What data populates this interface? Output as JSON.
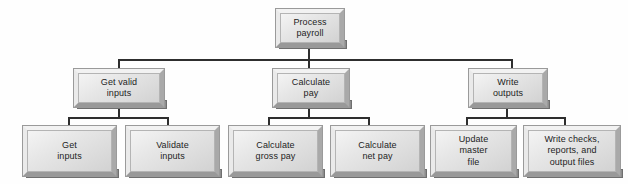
{
  "diagram": {
    "type": "structure-chart",
    "colors": {
      "background": "#fefefe",
      "box_face": "#dcdcdc",
      "box_highlight": "#f2f2f2",
      "box_shadow": "#8d8d8d",
      "connector": "#2e2e2e",
      "text": "#1d1d1d"
    },
    "levels": [
      {
        "level": 1,
        "nodes": [
          {
            "id": "process-payroll",
            "label": "Process\npayroll",
            "x": 275,
            "y": 8,
            "w": 70,
            "h": 40
          }
        ]
      },
      {
        "level": 2,
        "nodes": [
          {
            "id": "get-valid-inputs",
            "label": "Get valid\ninputs",
            "x": 73,
            "y": 68,
            "w": 92,
            "h": 40
          },
          {
            "id": "calculate-pay",
            "label": "Calculate\npay",
            "x": 272,
            "y": 68,
            "w": 78,
            "h": 40
          },
          {
            "id": "write-outputs",
            "label": "Write\noutputs",
            "x": 468,
            "y": 68,
            "w": 80,
            "h": 40
          }
        ]
      },
      {
        "level": 3,
        "nodes": [
          {
            "id": "get-inputs",
            "label": "Get\ninputs",
            "x": 22,
            "y": 125,
            "w": 95,
            "h": 52
          },
          {
            "id": "validate-inputs",
            "label": "Validate\ninputs",
            "x": 125,
            "y": 125,
            "w": 95,
            "h": 52
          },
          {
            "id": "calculate-gross-pay",
            "label": "Calculate\ngross pay",
            "x": 228,
            "y": 125,
            "w": 95,
            "h": 52
          },
          {
            "id": "calculate-net-pay",
            "label": "Calculate\nnet pay",
            "x": 330,
            "y": 125,
            "w": 95,
            "h": 52
          },
          {
            "id": "update-master-file",
            "label": "Update\nmaster\nfile",
            "x": 430,
            "y": 125,
            "w": 87,
            "h": 52
          },
          {
            "id": "write-checks-reports-output-files",
            "label": "Write checks,\nreports, and\noutput files",
            "x": 523,
            "y": 125,
            "w": 98,
            "h": 52
          }
        ]
      }
    ],
    "connectors": {
      "root_drop": {
        "x": 309,
        "y": 48,
        "h": 12
      },
      "main_bus": {
        "x": 118,
        "y": 59,
        "w": 395
      },
      "level2_drops": [
        {
          "x": 118,
          "y": 59,
          "h": 11
        },
        {
          "x": 309,
          "y": 59,
          "h": 11
        },
        {
          "x": 512,
          "y": 59,
          "h": 11
        }
      ],
      "level2_stems": [
        {
          "x": 118,
          "y": 106,
          "h": 12
        },
        {
          "x": 309,
          "y": 106,
          "h": 12
        },
        {
          "x": 507,
          "y": 106,
          "h": 12
        }
      ],
      "sub_buses": [
        {
          "x": 68,
          "y": 117,
          "w": 101
        },
        {
          "x": 268,
          "y": 117,
          "w": 102
        },
        {
          "x": 466,
          "y": 117,
          "w": 100
        }
      ],
      "level3_drops": [
        {
          "x": 68,
          "y": 117,
          "h": 9
        },
        {
          "x": 168,
          "y": 117,
          "h": 9
        },
        {
          "x": 268,
          "y": 117,
          "h": 9
        },
        {
          "x": 369,
          "y": 117,
          "h": 9
        },
        {
          "x": 466,
          "y": 117,
          "h": 9
        },
        {
          "x": 565,
          "y": 117,
          "h": 9
        }
      ]
    }
  }
}
